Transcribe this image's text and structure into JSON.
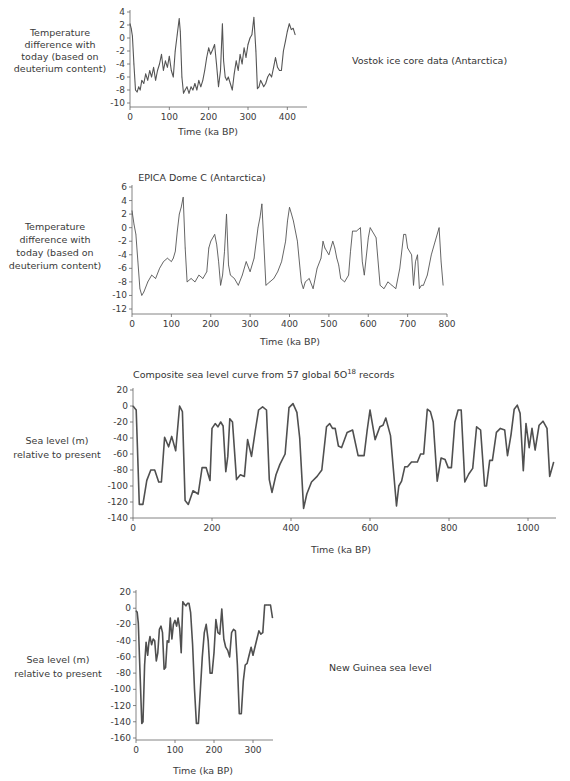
{
  "chart_data": [
    {
      "type": "line",
      "id": "vostok",
      "title": "Vostok ice core data (Antarctica)",
      "title_position": "right",
      "ylabel": [
        "Temperature",
        "difference with",
        "today (based on",
        "deuterium content)"
      ],
      "xlabel": "Time (ka BP)",
      "ylim": [
        -10,
        4
      ],
      "xlim": [
        0,
        420
      ],
      "yticks": [
        4,
        2,
        0,
        -2,
        -4,
        -6,
        -8,
        -10
      ],
      "xticks": [
        0,
        100,
        200,
        300,
        400
      ],
      "line_color": "#555555",
      "x": [
        0,
        3,
        6,
        10,
        14,
        18,
        22,
        26,
        30,
        35,
        40,
        45,
        50,
        55,
        60,
        65,
        70,
        75,
        80,
        85,
        90,
        95,
        100,
        105,
        110,
        115,
        120,
        125,
        128,
        132,
        136,
        140,
        145,
        150,
        155,
        160,
        165,
        170,
        175,
        180,
        185,
        190,
        195,
        200,
        205,
        210,
        215,
        220,
        225,
        230,
        235,
        238,
        242,
        246,
        250,
        255,
        260,
        265,
        270,
        275,
        280,
        285,
        290,
        295,
        300,
        305,
        310,
        315,
        320,
        324,
        328,
        332,
        336,
        340,
        345,
        350,
        355,
        360,
        365,
        370,
        375,
        380,
        385,
        390,
        395,
        400,
        405,
        410,
        415,
        420
      ],
      "values": [
        2.2,
        1.5,
        0.3,
        -4.0,
        -8.0,
        -8.3,
        -7.5,
        -8.0,
        -6.5,
        -7.0,
        -5.5,
        -6.5,
        -5.0,
        -6.0,
        -4.5,
        -6.5,
        -5.0,
        -4.0,
        -2.5,
        -5.0,
        -3.5,
        -4.5,
        -2.8,
        -5.0,
        -6.0,
        -2.0,
        0.5,
        3.0,
        1.0,
        -6.0,
        -8.5,
        -8.0,
        -7.5,
        -8.5,
        -7.5,
        -8.0,
        -7.0,
        -8.0,
        -6.5,
        -7.5,
        -6.5,
        -5.0,
        -3.0,
        -1.5,
        -2.5,
        -1.8,
        -1.0,
        -4.0,
        -7.5,
        -5.0,
        2.2,
        -3.5,
        -6.0,
        -6.5,
        -6.0,
        -7.0,
        -8.0,
        -5.5,
        -3.5,
        -5.0,
        -2.5,
        -4.0,
        -1.5,
        -3.0,
        -1.0,
        0.0,
        0.5,
        3.2,
        -2.0,
        -7.8,
        -7.5,
        -6.5,
        -7.0,
        -7.5,
        -7.0,
        -6.0,
        -5.5,
        -6.0,
        -4.5,
        -3.0,
        -4.5,
        -5.0,
        -5.0,
        -2.0,
        -0.5,
        1.0,
        2.2,
        1.3,
        1.5,
        0.5
      ]
    },
    {
      "type": "line",
      "id": "epica",
      "title": "EPICA Dome C (Antarctica)",
      "title_position": "top",
      "ylabel": [
        "Temperature",
        "difference with",
        "today (based on",
        "deuterium content)"
      ],
      "xlabel": "Time (ka BP)",
      "ylim": [
        -12,
        6
      ],
      "xlim": [
        0,
        800
      ],
      "yticks": [
        6,
        4,
        2,
        0,
        -2,
        -4,
        -6,
        -8,
        -10,
        -12
      ],
      "xticks": [
        0,
        100,
        200,
        300,
        400,
        500,
        600,
        700,
        800
      ],
      "line_color": "#555555",
      "x": [
        0,
        5,
        10,
        15,
        20,
        25,
        30,
        40,
        50,
        60,
        70,
        80,
        90,
        100,
        105,
        110,
        115,
        120,
        125,
        130,
        135,
        140,
        150,
        160,
        170,
        180,
        190,
        195,
        200,
        210,
        215,
        220,
        225,
        230,
        235,
        240,
        245,
        250,
        260,
        270,
        280,
        290,
        300,
        310,
        320,
        325,
        330,
        335,
        340,
        350,
        360,
        370,
        380,
        390,
        395,
        400,
        405,
        410,
        420,
        430,
        435,
        440,
        450,
        460,
        470,
        480,
        485,
        490,
        500,
        510,
        515,
        520,
        525,
        530,
        540,
        550,
        555,
        560,
        570,
        580,
        585,
        590,
        600,
        605,
        610,
        615,
        620,
        630,
        640,
        650,
        660,
        670,
        680,
        690,
        695,
        700,
        710,
        715,
        720,
        725,
        730,
        735,
        740,
        750,
        760,
        770,
        780,
        785,
        790
      ],
      "values": [
        2.5,
        0.5,
        -1.0,
        -5.0,
        -9.0,
        -10.0,
        -9.5,
        -8.0,
        -7.0,
        -7.5,
        -6.0,
        -5.0,
        -4.5,
        -5.0,
        -4.5,
        -3.5,
        -0.5,
        2.0,
        3.0,
        4.5,
        -3.0,
        -8.0,
        -7.5,
        -8.0,
        -7.0,
        -7.5,
        -6.5,
        -3.0,
        -2.0,
        -1.0,
        -2.5,
        -5.0,
        -8.5,
        -7.0,
        -3.5,
        2.0,
        -5.5,
        -7.0,
        -7.5,
        -8.5,
        -7.0,
        -5.0,
        -6.5,
        -4.5,
        0.0,
        1.5,
        3.5,
        -2.5,
        -8.5,
        -8.0,
        -7.5,
        -6.5,
        -5.0,
        -2.0,
        1.0,
        3.0,
        2.0,
        1.0,
        -2.0,
        -8.0,
        -9.0,
        -8.0,
        -7.5,
        -9.0,
        -6.0,
        -4.5,
        -2.0,
        -3.0,
        -4.0,
        -2.0,
        -3.0,
        -4.5,
        -5.5,
        -7.5,
        -8.0,
        -7.0,
        -3.5,
        -0.5,
        -0.5,
        0.0,
        -5.0,
        -7.0,
        -1.5,
        0.0,
        -0.5,
        -1.0,
        -1.5,
        -8.5,
        -9.0,
        -8.0,
        -8.5,
        -9.0,
        -6.0,
        -1.0,
        -1.0,
        -3.0,
        -4.0,
        -8.5,
        -5.0,
        -4.0,
        -9.0,
        -8.5,
        -8.5,
        -7.0,
        -4.0,
        -2.0,
        0.0,
        -5.0,
        -8.5
      ]
    },
    {
      "type": "line",
      "id": "composite",
      "title": "Composite sea level curve from 57 global δO18 records",
      "title_position": "top",
      "ylabel": [
        "Sea level (m)",
        "relative to present"
      ],
      "xlabel": "Time (ka BP)",
      "ylim": [
        -140,
        20
      ],
      "xlim": [
        0,
        1070
      ],
      "yticks": [
        20,
        0,
        -20,
        -40,
        -60,
        -80,
        -100,
        -120,
        -140
      ],
      "xticks": [
        0,
        200,
        400,
        600,
        800,
        1000
      ],
      "line_color": "#505050",
      "x": [
        0,
        8,
        16,
        25,
        35,
        45,
        55,
        65,
        72,
        80,
        90,
        98,
        108,
        118,
        125,
        132,
        140,
        152,
        165,
        175,
        185,
        195,
        200,
        208,
        215,
        222,
        228,
        235,
        240,
        245,
        252,
        262,
        272,
        282,
        290,
        300,
        310,
        318,
        328,
        338,
        345,
        352,
        362,
        372,
        385,
        395,
        405,
        415,
        422,
        432,
        440,
        452,
        466,
        478,
        490,
        498,
        505,
        512,
        520,
        528,
        542,
        556,
        570,
        585,
        593,
        600,
        613,
        625,
        633,
        640,
        652,
        667,
        673,
        680,
        688,
        695,
        705,
        720,
        728,
        736,
        745,
        753,
        760,
        770,
        780,
        790,
        798,
        806,
        815,
        823,
        831,
        840,
        850,
        860,
        870,
        880,
        890,
        895,
        903,
        910,
        920,
        930,
        941,
        948,
        957,
        965,
        973,
        980,
        988,
        995,
        1003,
        1010,
        1018,
        1028,
        1038,
        1048,
        1055,
        1065
      ],
      "values": [
        0,
        -5,
        -123,
        -123,
        -93,
        -80,
        -80,
        -95,
        -95,
        -39,
        -51,
        -38,
        -56,
        0,
        -7,
        -118,
        -123,
        -106,
        -110,
        -77,
        -77,
        -93,
        -28,
        -22,
        -26,
        -20,
        -25,
        -82,
        -63,
        -16,
        -20,
        -92,
        -86,
        -88,
        -42,
        -63,
        -30,
        -5,
        -1,
        -5,
        -92,
        -108,
        -86,
        -73,
        -60,
        -2,
        3,
        -8,
        -40,
        -128,
        -110,
        -95,
        -88,
        -80,
        -26,
        -22,
        -28,
        -28,
        -50,
        -52,
        -33,
        -30,
        -62,
        -62,
        -30,
        -5,
        -42,
        -26,
        -24,
        -15,
        -37,
        -125,
        -100,
        -94,
        -76,
        -76,
        -70,
        -70,
        -60,
        -60,
        -4,
        -7,
        -20,
        -94,
        -65,
        -67,
        -77,
        -77,
        -20,
        -5,
        -5,
        -95,
        -85,
        -78,
        -26,
        -30,
        -100,
        -100,
        -68,
        -68,
        -33,
        -28,
        -30,
        -62,
        -36,
        -4,
        1,
        -9,
        -81,
        -22,
        -52,
        -28,
        -55,
        -24,
        -19,
        -28,
        -88,
        -70,
        -75,
        2
      ]
    },
    {
      "type": "line",
      "id": "new-guinea",
      "title": "New Guinea sea level",
      "title_position": "right",
      "ylabel": [
        "Sea level (m)",
        "relative to present"
      ],
      "xlabel": "Time (ka BP)",
      "ylim": [
        -160,
        20
      ],
      "xlim": [
        0,
        350
      ],
      "yticks": [
        20,
        0,
        -20,
        -40,
        -60,
        -80,
        -100,
        -120,
        -140,
        -160
      ],
      "xticks": [
        0,
        100,
        200,
        300
      ],
      "line_color": "#505050",
      "x": [
        0,
        3,
        6,
        10,
        15,
        18,
        22,
        26,
        30,
        33,
        36,
        40,
        44,
        48,
        52,
        56,
        60,
        64,
        68,
        72,
        76,
        80,
        84,
        88,
        92,
        96,
        100,
        104,
        108,
        112,
        116,
        120,
        124,
        128,
        132,
        136,
        140,
        145,
        150,
        155,
        160,
        165,
        170,
        175,
        180,
        185,
        190,
        195,
        200,
        205,
        210,
        215,
        220,
        225,
        230,
        235,
        240,
        245,
        250,
        255,
        260,
        265,
        270,
        275,
        280,
        285,
        290,
        295,
        300,
        305,
        310,
        315,
        320,
        325,
        330,
        335,
        340,
        345,
        350
      ],
      "values": [
        -3,
        -5,
        -18,
        -75,
        -142,
        -140,
        -70,
        -42,
        -58,
        -42,
        -35,
        -45,
        -38,
        -40,
        -65,
        -55,
        -26,
        -22,
        -30,
        -75,
        -73,
        -40,
        -42,
        -12,
        -38,
        -20,
        -15,
        -22,
        -12,
        -25,
        -55,
        8,
        5,
        3,
        6,
        6,
        -5,
        -45,
        -100,
        -142,
        -142,
        -100,
        -60,
        -30,
        -20,
        -40,
        -80,
        -80,
        -55,
        -14,
        -30,
        -32,
        -1,
        -38,
        -48,
        -52,
        -60,
        -30,
        -26,
        -28,
        -70,
        -130,
        -130,
        -90,
        -70,
        -68,
        -58,
        -48,
        -58,
        -48,
        -38,
        -28,
        -32,
        -30,
        4,
        4,
        4,
        4,
        -12
      ]
    }
  ]
}
